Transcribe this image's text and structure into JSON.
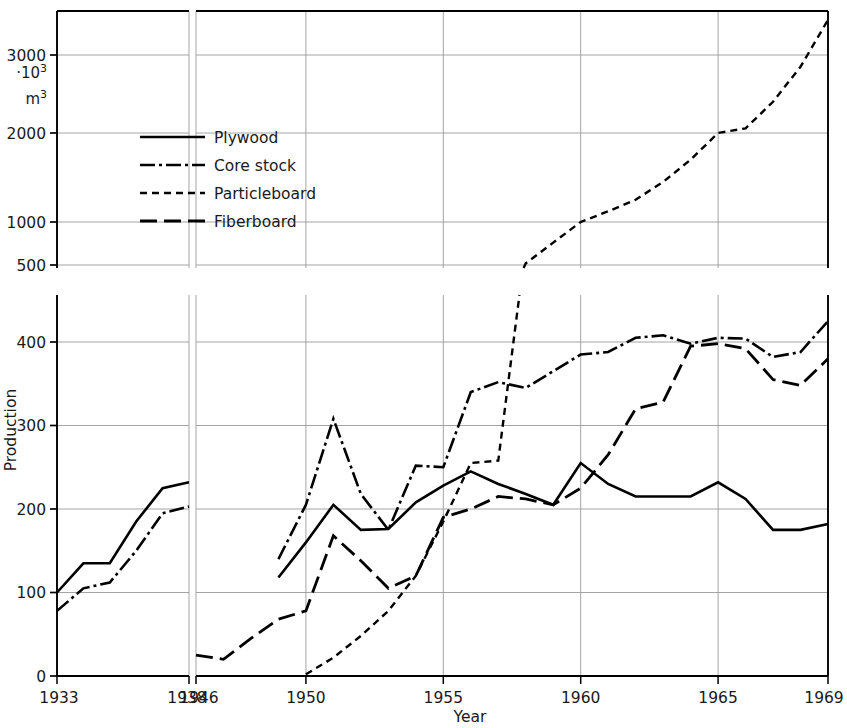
{
  "chart_data": {
    "type": "line",
    "title": "",
    "xlabel": "Year",
    "ylabel": "Production",
    "yunit_primary": "·10",
    "yunit_exp": "3",
    "yunit_secondary": "m",
    "yunit_secondary_exp": "3",
    "grid": true,
    "legend_position": "upper-left-inside",
    "broken_axis": true,
    "panels": [
      {
        "name": "left-panel",
        "xlim": [
          1933,
          1938
        ],
        "xticks": [
          1933,
          1938
        ],
        "xtick_labels": [
          "1933",
          "1938"
        ]
      },
      {
        "name": "right-panel",
        "xlim": [
          1946,
          1969
        ],
        "xticks": [
          1946,
          1950,
          1955,
          1960,
          1965,
          1969
        ],
        "xtick_labels": [
          "1946",
          "1950",
          "1955",
          "1960",
          "1965",
          "1969"
        ]
      }
    ],
    "y_lower_ticks": [
      0,
      100,
      200,
      300,
      400
    ],
    "y_lower_tick_labels": [
      "0",
      "100",
      "200",
      "300",
      "400"
    ],
    "y_upper_ticks": [
      500,
      1000,
      2000,
      3000
    ],
    "y_upper_tick_labels": [
      "500",
      "1000",
      "2000",
      "3000"
    ],
    "ylim_lower": [
      0,
      460
    ],
    "ylim_upper": [
      500,
      3600
    ],
    "series": [
      {
        "name": "Plywood",
        "style": "solid",
        "left_x": [
          1933,
          1934,
          1935,
          1936,
          1937,
          1938
        ],
        "left_values": [
          100,
          135,
          135,
          185,
          225,
          232
        ],
        "x": [
          1949,
          1950,
          1951,
          1952,
          1953,
          1954,
          1955,
          1956,
          1957,
          1958,
          1959,
          1960,
          1961,
          1962,
          1963,
          1964,
          1965,
          1966,
          1967,
          1968,
          1969
        ],
        "values": [
          118,
          160,
          205,
          175,
          176,
          208,
          228,
          245,
          230,
          218,
          205,
          255,
          230,
          215,
          215,
          215,
          232,
          212,
          175,
          175,
          182
        ]
      },
      {
        "name": "Core stock",
        "style": "dashdot",
        "left_x": [
          1933,
          1934,
          1935,
          1936,
          1937,
          1938
        ],
        "left_values": [
          78,
          105,
          112,
          150,
          195,
          203
        ],
        "x": [
          1949,
          1950,
          1951,
          1952,
          1953,
          1954,
          1955,
          1956,
          1957,
          1958,
          1959,
          1960,
          1961,
          1962,
          1963,
          1964,
          1965,
          1966,
          1967,
          1968,
          1969
        ],
        "values": [
          140,
          205,
          308,
          218,
          175,
          252,
          250,
          340,
          352,
          345,
          365,
          385,
          388,
          405,
          408,
          398,
          405,
          404,
          382,
          388,
          425
        ]
      },
      {
        "name": "Particleboard",
        "style": "dashed-short",
        "left_x": [],
        "left_values": [],
        "x": [
          1950,
          1951,
          1952,
          1953,
          1954,
          1955,
          1956,
          1957,
          1958,
          1959,
          1960,
          1961,
          1962,
          1963,
          1964,
          1965,
          1966,
          1967,
          1968,
          1969
        ],
        "values": [
          2,
          22,
          48,
          78,
          120,
          185,
          255,
          258,
          520,
          760,
          1000,
          1120,
          1250,
          1450,
          1700,
          2000,
          2060,
          2400,
          2850,
          3450
        ]
      },
      {
        "name": "Fiberboard",
        "style": "dashed-long",
        "left_x": [],
        "left_values": [],
        "x": [
          1946,
          1947,
          1948,
          1949,
          1950,
          1951,
          1952,
          1953,
          1954,
          1955,
          1956,
          1957,
          1958,
          1959,
          1960,
          1961,
          1962,
          1963,
          1964,
          1965,
          1966,
          1967,
          1968,
          1969
        ],
        "values": [
          25,
          20,
          45,
          68,
          78,
          168,
          138,
          105,
          120,
          190,
          200,
          215,
          212,
          205,
          225,
          265,
          320,
          328,
          395,
          398,
          392,
          355,
          348,
          380
        ]
      }
    ]
  },
  "legend": {
    "items": [
      {
        "label": "Plywood",
        "style": "solid"
      },
      {
        "label": "Core stock",
        "style": "dashdot"
      },
      {
        "label": "Particleboard",
        "style": "dashed-short"
      },
      {
        "label": "Fiberboard",
        "style": "dashed-long"
      }
    ]
  },
  "axes": {
    "ylabel": "Production",
    "xlabel": "Year",
    "unit_line1": "·10",
    "unit_line1_sup": "3",
    "unit_line2": "m",
    "unit_line2_sup": "3"
  },
  "colors": {
    "line": "#000000",
    "grid": "#9a9a9a",
    "frame": "#000000",
    "background": "#ffffff"
  }
}
